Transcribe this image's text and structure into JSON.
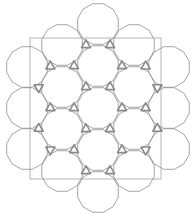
{
  "diagram": {
    "kind": "dodecagon-triangle tiling patch",
    "canvas": {
      "width": 196,
      "height": 218,
      "background": "#ffffff"
    },
    "frame_rect": {
      "x": 30,
      "y": 38,
      "width": 131,
      "height": 141,
      "stroke": "#b5b5b5"
    },
    "dodecagon": {
      "radius": 21,
      "stroke": "#9a9a9a",
      "stroke_width": 0.9
    },
    "triangle": {
      "size": 5.2,
      "stroke": "#8a8a8a",
      "stroke_width": 1.6
    },
    "dodecagon_centers": [
      [
        98,
        24
      ],
      [
        98,
        66
      ],
      [
        98,
        108
      ],
      [
        98,
        150
      ],
      [
        98,
        192
      ],
      [
        62,
        45
      ],
      [
        62,
        87
      ],
      [
        62,
        129
      ],
      [
        62,
        171
      ],
      [
        134,
        45
      ],
      [
        134,
        87
      ],
      [
        134,
        129
      ],
      [
        134,
        171
      ],
      [
        27,
        67
      ],
      [
        27,
        108
      ],
      [
        27,
        149
      ],
      [
        169,
        67
      ],
      [
        169,
        108
      ],
      [
        169,
        149
      ]
    ]
  }
}
